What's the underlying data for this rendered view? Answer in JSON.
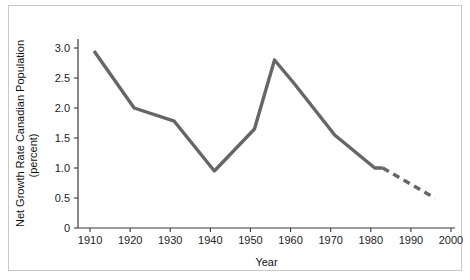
{
  "chart_data": {
    "type": "line",
    "title": "",
    "xlabel": "Year",
    "ylabel": "Net Growth Rate Canadian Population (percent)",
    "ylabel_line1": "Net Growth Rate Canadian Population",
    "ylabel_line2": "(percent)",
    "xlim": [
      1907,
      2001
    ],
    "ylim": [
      0,
      3.15
    ],
    "grid": false,
    "legend": "none",
    "line_color": "#666666",
    "xticks": [
      1910,
      1920,
      1930,
      1940,
      1950,
      1960,
      1970,
      1980,
      1990,
      2000
    ],
    "xtick_labels": [
      "1910",
      "1920",
      "1930",
      "1940",
      "1950",
      "1960",
      "1970",
      "1980",
      "1990",
      "2000"
    ],
    "yticks": [
      0,
      0.5,
      1.0,
      1.5,
      2.0,
      2.5,
      3.0
    ],
    "ytick_labels": [
      "0",
      "0.5",
      "1.0",
      "1.5",
      "2.0",
      "2.5",
      "3.0"
    ],
    "series": [
      {
        "name": "Net growth rate (observed)",
        "style": "solid",
        "color": "#666666",
        "x": [
          1911,
          1921,
          1931,
          1941,
          1951,
          1956,
          1961,
          1971,
          1981,
          1983
        ],
        "values": [
          2.95,
          2.0,
          1.78,
          0.95,
          1.65,
          2.8,
          2.4,
          1.55,
          1.0,
          1.0
        ]
      },
      {
        "name": "Net growth rate (projected)",
        "style": "dashed",
        "color": "#666666",
        "x": [
          1983,
          1996
        ],
        "values": [
          1.0,
          0.5
        ]
      }
    ]
  }
}
